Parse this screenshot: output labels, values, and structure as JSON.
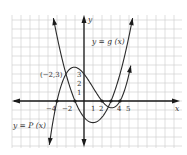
{
  "chart_data": {
    "type": "line",
    "title": "",
    "xlabel": "x",
    "ylabel": "y",
    "xlim": [
      -8,
      10.9
    ],
    "ylim": [
      -5.2,
      9.6
    ],
    "grid": true,
    "x_tick_labels": [
      {
        "value": -4,
        "text": "-4"
      },
      {
        "value": -2,
        "text": "−2"
      },
      {
        "value": 1,
        "text": "1"
      },
      {
        "value": 2,
        "text": "2"
      },
      {
        "value": 4,
        "text": "4"
      },
      {
        "value": 5,
        "text": "5"
      }
    ],
    "y_tick_labels": [
      {
        "value": 1,
        "text": "1"
      },
      {
        "value": 2,
        "text": "2"
      },
      {
        "value": 3,
        "text": "3"
      }
    ],
    "series": [
      {
        "name": "y = P(x)",
        "kind": "cubic",
        "formula": "P(x) = (1/8)(x+3)(x-2)(x-4)",
        "roots": [
          -3,
          2,
          4
        ],
        "domain": [
          -4.6,
          5.2
        ],
        "points": [
          [
            -4.5,
            -5.2
          ],
          [
            -3,
            0
          ],
          [
            -2,
            3
          ],
          [
            0,
            3
          ],
          [
            2,
            0
          ],
          [
            3,
            -0.75
          ],
          [
            4,
            0
          ],
          [
            5,
            3
          ]
        ]
      },
      {
        "name": "y = g(x)",
        "kind": "parabola",
        "formula": "g(x) = 0.6(x+1)(x-3)",
        "roots": [
          -1,
          3
        ],
        "vertex": [
          1,
          -2.4
        ],
        "domain": [
          -3.4,
          5.4
        ],
        "points": [
          [
            -3,
            7.2
          ],
          [
            -2,
            3
          ],
          [
            -1,
            0
          ],
          [
            1,
            -2.4
          ],
          [
            3,
            0
          ],
          [
            5,
            7.2
          ]
        ]
      }
    ],
    "marked_points": [
      {
        "x": -3,
        "y": 0
      },
      {
        "x": -1,
        "y": 0
      },
      {
        "x": 2,
        "y": 0
      },
      {
        "x": 3,
        "y": 0
      },
      {
        "x": 4,
        "y": 0
      }
    ],
    "annotations": [
      {
        "text": "(−2, 3)",
        "x": -2,
        "y": 3
      },
      {
        "text": "y = g(x)",
        "x": 2.6,
        "y": 6.5
      },
      {
        "text": "y = P(x)",
        "x": -7.8,
        "y": -2.8
      }
    ]
  },
  "labels": {
    "x_axis": "x",
    "y_axis": "y",
    "point": "(−2,3)",
    "g_label": "y = g (x)",
    "p_label": "y = P (x)",
    "xt_m4": "−4",
    "xt_m2": "−2",
    "xt_1": "1",
    "xt_2": "2",
    "xt_4": "4",
    "xt_5": "5",
    "yt_1": "1",
    "yt_2": "2",
    "yt_3": "3"
  }
}
